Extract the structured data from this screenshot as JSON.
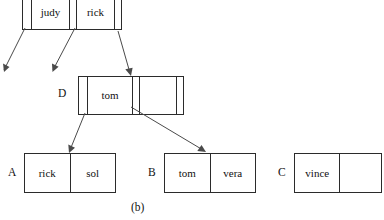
{
  "figure": {
    "caption": "(b)",
    "type": "b-tree-index-diagram"
  },
  "nodes": {
    "root": {
      "label": "",
      "cells": [
        "",
        "judy",
        "",
        "rick",
        ""
      ],
      "keys": [
        "judy",
        "rick"
      ]
    },
    "internal_d": {
      "label": "D",
      "cells": [
        "",
        "tom",
        "",
        "",
        ""
      ],
      "keys": [
        "tom"
      ]
    },
    "leaf_a": {
      "label": "A",
      "cells": [
        "rick",
        "sol"
      ],
      "keys": [
        "rick",
        "sol"
      ]
    },
    "leaf_b": {
      "label": "B",
      "cells": [
        "tom",
        "vera"
      ],
      "keys": [
        "tom",
        "vera"
      ]
    },
    "leaf_c": {
      "label": "C",
      "cells": [
        "vince",
        ""
      ],
      "keys": [
        "vince"
      ]
    }
  },
  "arrows": [
    {
      "name": "root-ptr0-out-left",
      "from": [
        24,
        30
      ],
      "to": [
        2,
        72
      ]
    },
    {
      "name": "root-ptr1-out-left",
      "from": [
        74,
        30
      ],
      "to": [
        52,
        72
      ]
    },
    {
      "name": "root-ptr2-to-node-d",
      "from": [
        118,
        33
      ],
      "to": [
        131,
        75
      ]
    },
    {
      "name": "node-d-ptr0-to-leaf-a",
      "from": [
        85,
        113
      ],
      "to": [
        69,
        153
      ]
    },
    {
      "name": "node-d-ptr1-to-leaf-b",
      "from": [
        131,
        107
      ],
      "to": [
        206,
        153
      ]
    }
  ],
  "colors": {
    "stroke": "#2b2b2b",
    "arrow": "#4a4a4a",
    "text": "#111111",
    "background": "#ffffff"
  }
}
